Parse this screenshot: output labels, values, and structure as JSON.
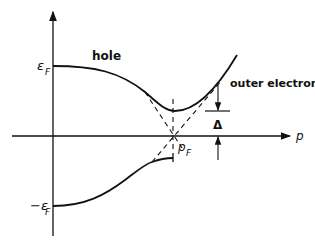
{
  "diagram": {
    "axis": {
      "x_label": "p",
      "y_levels": [
        {
          "label": "ε",
          "sub": "F"
        },
        {
          "label": "−ε",
          "sub": "F"
        }
      ]
    },
    "labels": {
      "hole": "hole",
      "outer_electron": "outer electron",
      "gap": "Δ",
      "pf_main": "p",
      "pf_sub": "F",
      "ef_main": "ε",
      "ef_sub": "F",
      "mef_main": "−ε",
      "mef_sub": "F"
    },
    "colors": {
      "line": "#111111",
      "background": "#ffffff"
    }
  }
}
